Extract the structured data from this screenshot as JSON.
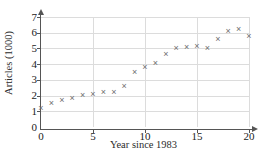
{
  "chart_data": {
    "type": "scatter",
    "title": "",
    "xlabel": "Year since 1983",
    "ylabel": "Articles (1000)",
    "xlim": [
      0,
      20
    ],
    "ylim": [
      0,
      7
    ],
    "xticks": [
      0,
      5,
      10,
      15,
      20
    ],
    "yticks": [
      0,
      1,
      2,
      3,
      4,
      5,
      6,
      7
    ],
    "grid": true,
    "legend": null,
    "marker": "x",
    "marker_color": "#6e6e6e",
    "x": [
      0,
      1,
      2,
      3,
      4,
      5,
      6,
      7,
      8,
      9,
      10,
      11,
      12,
      13,
      14,
      15,
      16,
      17,
      18,
      19,
      20
    ],
    "y": [
      1.2,
      1.5,
      1.7,
      1.8,
      2.0,
      2.1,
      2.2,
      2.2,
      2.6,
      3.5,
      3.8,
      4.05,
      4.6,
      5.0,
      5.05,
      5.1,
      5.0,
      5.6,
      6.1,
      6.2,
      5.75
    ]
  },
  "axes": {
    "x_tick_labels": [
      "0",
      "5",
      "10",
      "15",
      "20"
    ],
    "y_tick_labels": [
      "0",
      "1",
      "2",
      "3",
      "4",
      "5",
      "6",
      "7"
    ]
  }
}
